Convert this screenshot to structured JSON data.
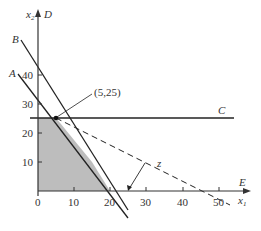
{
  "diagram": {
    "type": "linear-programming-feasible-region",
    "axes": {
      "x_label": "x1",
      "x_label_main": "x",
      "x_label_sub": "1",
      "y_label": "x2",
      "y_label_main": "x",
      "y_label_sub": "2",
      "x_ticks": [
        "0",
        "10",
        "20",
        "30",
        "40",
        "50"
      ],
      "y_ticks": [
        "10",
        "20",
        "30",
        "40"
      ],
      "x_axis_end_label": "E",
      "y_axis_end_label": "D"
    },
    "lines": [
      {
        "id": "A",
        "label": "A",
        "style": "solid",
        "description": "constraint line A"
      },
      {
        "id": "B",
        "label": "B",
        "style": "solid",
        "description": "constraint line B"
      },
      {
        "id": "C",
        "label": "C",
        "style": "solid",
        "description": "horizontal constraint x2 = 25"
      },
      {
        "id": "z",
        "label": "z",
        "style": "dashed",
        "description": "objective function line"
      }
    ],
    "optimal_point": {
      "label": "(5,25)",
      "x": 5,
      "y": 25
    },
    "feasible_region": {
      "fill": "#bdbdbd",
      "vertices": [
        [
          0,
          0
        ],
        [
          0,
          25
        ],
        [
          5,
          25
        ],
        [
          15,
          10
        ],
        [
          20,
          0
        ]
      ]
    },
    "colors": {
      "line": "#222222",
      "axis": "#333333",
      "region": "#bdbdbd",
      "text": "#333333"
    }
  }
}
